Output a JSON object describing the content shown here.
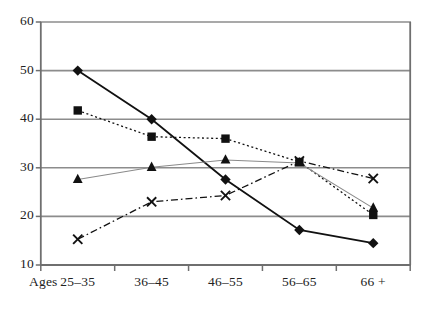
{
  "chart_data": {
    "type": "line",
    "title": "",
    "subtitle": "",
    "xlabel": "Ages",
    "ylabel": "",
    "categories": [
      "25–35",
      "36–45",
      "46–55",
      "56–65",
      "66 +"
    ],
    "x_tick_labels": [
      "25–35",
      "36–45",
      "46–55",
      "56–65",
      "66 +"
    ],
    "y_tick_labels": [
      "10",
      "20",
      "30",
      "40",
      "50",
      "60"
    ],
    "y_ticks": [
      10,
      20,
      30,
      40,
      50,
      60
    ],
    "ylim": [
      10,
      60
    ],
    "grid": "horizontal",
    "legend": "none",
    "series": [
      {
        "name": "series-diamond",
        "marker": "diamond",
        "line_style": "solid",
        "color": "#111111",
        "values": [
          50.0,
          40.0,
          27.6,
          17.2,
          14.5
        ]
      },
      {
        "name": "series-square",
        "marker": "square",
        "line_style": "dotted",
        "color": "#111111",
        "values": [
          41.8,
          36.4,
          36.0,
          31.2,
          20.3
        ]
      },
      {
        "name": "series-triangle",
        "marker": "triangle",
        "line_style": "solid-thin",
        "color": "#8a8a8a",
        "values": [
          27.6,
          30.1,
          31.6,
          31.0,
          21.7
        ]
      },
      {
        "name": "series-cross",
        "marker": "cross",
        "line_style": "dash-dot",
        "color": "#111111",
        "values": [
          15.3,
          23.0,
          24.3,
          31.4,
          27.8
        ]
      }
    ]
  },
  "axes": {
    "ages_caption": "Ages"
  },
  "style": {
    "grid_color": "#8c8c8c",
    "axis_color": "#6f6f6f",
    "marker_color": "#111111",
    "thin_series_color": "#8a8a8a",
    "background": "#ffffff"
  }
}
